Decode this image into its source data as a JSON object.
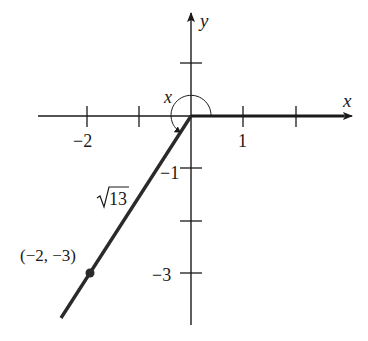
{
  "diagram": {
    "type": "coordinate-plane-angle",
    "axes": {
      "x_label": "x",
      "y_label": "y",
      "x_tick_labels": [
        {
          "value": -2,
          "text": "−2"
        },
        {
          "value": 1,
          "text": "1"
        }
      ],
      "y_tick_labels": [
        {
          "value": -1,
          "text": "−1"
        },
        {
          "value": -3,
          "text": "−3"
        }
      ],
      "x_ticks": [
        -2,
        -1,
        1,
        2
      ],
      "y_ticks": [
        1,
        -1,
        -2,
        -3
      ]
    },
    "angle_label": "x",
    "terminal_point": {
      "x": -2,
      "y": -3,
      "label": "(−2, −3)"
    },
    "segment_length_label_radicand": "13",
    "colors": {
      "axis": "#1a1a1a",
      "ray": "#2a2a2a",
      "background": "#ffffff"
    }
  }
}
